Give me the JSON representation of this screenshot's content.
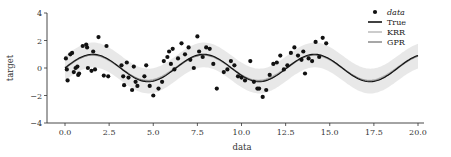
{
  "chart_data": {
    "type": "scatter",
    "title": "",
    "xlabel": "data",
    "ylabel": "target",
    "xlim": [
      -1,
      21
    ],
    "ylim": [
      -4,
      4
    ],
    "xticks": [
      0.0,
      2.5,
      5.0,
      7.5,
      10.0,
      12.5,
      15.0,
      17.5,
      20.0
    ],
    "xtick_labels": [
      "0.0",
      "2.5",
      "5.0",
      "7.5",
      "10.0",
      "12.5",
      "15.0",
      "17.5",
      "20.0"
    ],
    "yticks": [
      -4,
      -2,
      0,
      2,
      4
    ],
    "ytick_labels": [
      "−4",
      "−2",
      "0",
      "2",
      "4"
    ],
    "grid": false,
    "legend": {
      "placement": "top-right",
      "entries": [
        {
          "label": "data",
          "style": "marker"
        },
        {
          "label": "True",
          "style": "line",
          "color": "#111111"
        },
        {
          "label": "KRR",
          "style": "line",
          "color": "#b0b0b0"
        },
        {
          "label": "GPR",
          "style": "line",
          "color": "#777777"
        }
      ]
    },
    "series": [
      {
        "name": "data",
        "type": "scatter",
        "color": "#111111",
        "x": [
          0.05,
          0.1,
          0.15,
          0.3,
          0.4,
          0.5,
          0.6,
          0.7,
          0.75,
          0.8,
          1.0,
          1.2,
          1.25,
          1.3,
          1.5,
          1.6,
          1.7,
          1.9,
          2.2,
          2.35,
          2.45,
          3.2,
          3.3,
          3.35,
          3.5,
          3.6,
          3.8,
          3.9,
          4.0,
          4.1,
          4.5,
          4.6,
          4.8,
          5.0,
          5.3,
          5.5,
          5.6,
          5.8,
          5.9,
          6.0,
          6.1,
          6.2,
          6.4,
          6.6,
          6.8,
          7.0,
          7.1,
          7.3,
          7.5,
          7.6,
          7.8,
          8.0,
          8.2,
          8.4,
          8.6,
          9.0,
          9.2,
          9.4,
          9.6,
          9.8,
          10.0,
          10.2,
          10.5,
          10.7,
          10.9,
          11.0,
          11.2,
          11.4,
          11.6,
          11.8,
          12.0,
          12.2,
          12.4,
          12.6,
          12.8,
          13.0,
          13.2,
          13.4,
          13.5,
          13.6,
          13.8,
          14.0,
          14.2,
          14.4,
          14.6,
          14.8
        ],
        "y": [
          0.7,
          -0.1,
          -0.9,
          1.0,
          1.1,
          -0.3,
          0.0,
          0.1,
          -0.5,
          -0.4,
          1.6,
          1.7,
          1.5,
          0.0,
          -0.2,
          1.2,
          -0.1,
          2.25,
          -0.55,
          1.6,
          -0.6,
          0.2,
          -0.6,
          -1.25,
          0.4,
          -0.7,
          -1.6,
          0.1,
          -1.0,
          -1.3,
          -0.6,
          0.2,
          -1.3,
          -2.0,
          -1.5,
          -1.0,
          0.5,
          0.8,
          1.2,
          0.3,
          1.4,
          -0.1,
          0.7,
          1.8,
          1.0,
          1.5,
          0.6,
          0.0,
          2.3,
          1.2,
          0.8,
          1.5,
          1.4,
          0.3,
          -1.5,
          -0.3,
          -0.1,
          0.5,
          0.2,
          -0.6,
          -0.7,
          -0.9,
          0.5,
          -1.0,
          -1.5,
          -1.5,
          -2.1,
          -1.6,
          -0.5,
          0.3,
          0.4,
          0.9,
          -0.1,
          0.2,
          1.1,
          1.5,
          0.9,
          0.6,
          1.2,
          -0.4,
          0.7,
          0.5,
          1.9,
          0.8,
          2.2,
          1.8
        ]
      },
      {
        "name": "True",
        "type": "line",
        "function": "sin(x)",
        "x_range": [
          0,
          20
        ]
      },
      {
        "name": "KRR",
        "type": "line",
        "x_range": [
          0,
          20
        ]
      },
      {
        "name": "GPR",
        "type": "line",
        "x_range": [
          0,
          20
        ],
        "confidence_band_halfwidth": 0.9
      }
    ]
  }
}
